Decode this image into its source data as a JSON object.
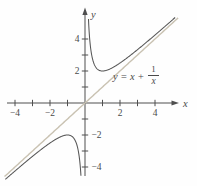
{
  "figure": {
    "background": "#fefefe",
    "ink_color": "#4f4f4f"
  },
  "chart_data": {
    "type": "line",
    "title": "",
    "xlabel": "x",
    "ylabel": "y",
    "xlim": [
      -4.9,
      5.4
    ],
    "ylim": [
      -5.2,
      5.8
    ],
    "grid": false,
    "legend": false,
    "x_ticks": [
      -4,
      -3,
      -2,
      -1,
      1,
      2,
      3,
      4
    ],
    "y_ticks": [
      -4,
      -3,
      -2,
      -1,
      1,
      2,
      3,
      4
    ],
    "x_labeled_ticks": [
      {
        "v": -4,
        "t": "−4"
      },
      {
        "v": -2,
        "t": "−2"
      },
      {
        "v": 2,
        "t": "2"
      },
      {
        "v": 4,
        "t": "4"
      }
    ],
    "y_labeled_ticks": [
      {
        "v": 4,
        "t": "4",
        "side": "left"
      },
      {
        "v": 2,
        "t": "2",
        "side": "left"
      },
      {
        "v": -2,
        "t": "−2",
        "side": "right"
      },
      {
        "v": -4,
        "t": "−4",
        "side": "right"
      }
    ],
    "series": [
      {
        "name": "y = x + 1/x (negative branch)",
        "fn": "x + 1/x",
        "x_domain": [
          -4.55,
          -0.232
        ],
        "color": "#555555",
        "width": 1.05
      },
      {
        "name": "y = x + 1/x (positive branch)",
        "fn": "x + 1/x",
        "x_domain": [
          0.198,
          5.15
        ],
        "color": "#555555",
        "width": 1.05
      }
    ],
    "asymptote": {
      "name": "y = x",
      "fn": "x",
      "x_domain": [
        -4.6,
        5.32
      ],
      "color": "#c9c2b2",
      "width": 1.4
    },
    "key_points": {
      "local_min": [
        1,
        2
      ],
      "local_max": [
        -1,
        -2
      ]
    },
    "annotation": {
      "text": "y = x + 1/x",
      "prefix": "y = x +",
      "frac_num": "1",
      "frac_den": "x"
    }
  }
}
